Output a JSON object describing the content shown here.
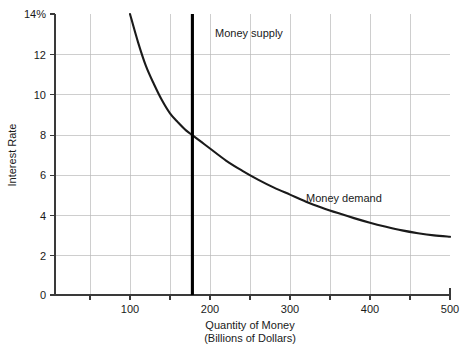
{
  "chart_data": {
    "type": "line",
    "title": "",
    "xlabel": "Quantity of Money",
    "xlabel_sub": "(Billions of Dollars)",
    "ylabel": "Interest Rate",
    "xlim": [
      0,
      500
    ],
    "ylim": [
      0,
      14
    ],
    "grid": true,
    "legend_position": "inline-annotations",
    "x_ticks": [
      {
        "value": 100,
        "label": "100"
      },
      {
        "value": 200,
        "label": "200"
      },
      {
        "value": 300,
        "label": "300"
      },
      {
        "value": 400,
        "label": "400"
      },
      {
        "value": 500,
        "label": "500"
      }
    ],
    "x_gridline_values": [
      50,
      100,
      150,
      200,
      250,
      300,
      350,
      400,
      450,
      500
    ],
    "y_ticks": [
      {
        "value": 0,
        "label": "0"
      },
      {
        "value": 2,
        "label": "2"
      },
      {
        "value": 4,
        "label": "4"
      },
      {
        "value": 6,
        "label": "6"
      },
      {
        "value": 8,
        "label": "8"
      },
      {
        "value": 10,
        "label": "10"
      },
      {
        "value": 12,
        "label": "12"
      },
      {
        "value": 14,
        "label": "14%"
      }
    ],
    "series": [
      {
        "name": "Money demand",
        "type": "curve",
        "annotation": "Money demand",
        "annotation_x": 345,
        "annotation_y": 4.9,
        "color": "#1a1a1a",
        "points": [
          {
            "x": 100,
            "y": 14.0
          },
          {
            "x": 110,
            "y": 12.6
          },
          {
            "x": 120,
            "y": 11.4
          },
          {
            "x": 130,
            "y": 10.5
          },
          {
            "x": 140,
            "y": 9.7
          },
          {
            "x": 150,
            "y": 9.05
          },
          {
            "x": 160,
            "y": 8.6
          },
          {
            "x": 170,
            "y": 8.2
          },
          {
            "x": 180,
            "y": 7.9
          },
          {
            "x": 190,
            "y": 7.6
          },
          {
            "x": 200,
            "y": 7.3
          },
          {
            "x": 220,
            "y": 6.7
          },
          {
            "x": 240,
            "y": 6.2
          },
          {
            "x": 260,
            "y": 5.75
          },
          {
            "x": 280,
            "y": 5.35
          },
          {
            "x": 300,
            "y": 5.0
          },
          {
            "x": 320,
            "y": 4.65
          },
          {
            "x": 340,
            "y": 4.35
          },
          {
            "x": 360,
            "y": 4.08
          },
          {
            "x": 380,
            "y": 3.83
          },
          {
            "x": 400,
            "y": 3.6
          },
          {
            "x": 420,
            "y": 3.4
          },
          {
            "x": 440,
            "y": 3.22
          },
          {
            "x": 460,
            "y": 3.08
          },
          {
            "x": 480,
            "y": 2.97
          },
          {
            "x": 500,
            "y": 2.9
          }
        ]
      },
      {
        "name": "Money supply",
        "type": "vertical-line",
        "annotation": "Money supply",
        "annotation_x": 225,
        "annotation_y": 13.05,
        "color": "#000000",
        "x_value": 178,
        "y_from": 0,
        "y_to": 14
      }
    ],
    "equilibrium": {
      "x": 178,
      "y": 7.95
    }
  }
}
